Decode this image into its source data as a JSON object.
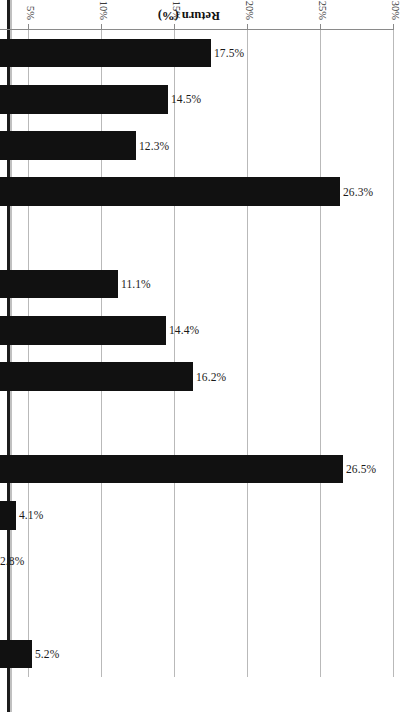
{
  "figure": {
    "orientation": "page-rotated-90",
    "axis_title": "Return (%)",
    "background_color": "#ffffff",
    "bar_color": "#111111",
    "gridline_color": "#b9b9b9",
    "axis_color": "#8a8a8a"
  },
  "chart_data": {
    "type": "bar",
    "title": "",
    "xlabel": "",
    "ylabel": "Return (%)",
    "ylim": [
      -10,
      30
    ],
    "yticks": [
      30,
      25,
      20,
      15,
      10,
      5,
      0,
      -5,
      -10
    ],
    "ytick_labels": [
      "30%",
      "25%",
      "20%",
      "15%",
      "10%",
      "5%",
      "0%",
      "-5%",
      "-10%"
    ],
    "grid": true,
    "legend": null,
    "categories": [
      "1990",
      "1991",
      "1992",
      "1993",
      "1994",
      "1995",
      "1996",
      "1997",
      "1998",
      "1999",
      "2000",
      "2001",
      "2002",
      "YTD 2003"
    ],
    "values": [
      17.5,
      14.5,
      12.3,
      26.3,
      -3.5,
      11.1,
      14.4,
      16.2,
      -5.1,
      26.5,
      4.1,
      2.8,
      1.0,
      5.2
    ],
    "data_labels": [
      "17.5%",
      "14.5%",
      "12.3%",
      "26.3%",
      "-3.5%",
      "11.1%",
      "14.4%",
      "16.2%",
      "-5.1%",
      "26.5%",
      "4.1%",
      "2.8%",
      "1.0%",
      "5.2%"
    ]
  }
}
